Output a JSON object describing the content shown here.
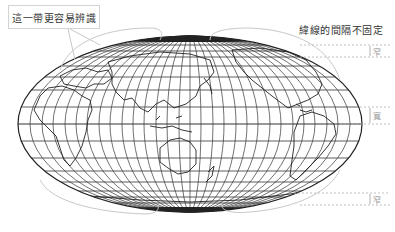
{
  "callout": {
    "text": "這一帶更容易辨識"
  },
  "note": {
    "text": "緯線的間隔不固定"
  },
  "bands": [
    {
      "label": "窄",
      "y_top": 45,
      "y_bottom": 57
    },
    {
      "label": "寬",
      "y_top": 107,
      "y_bottom": 124
    },
    {
      "label": "窄",
      "y_top": 193,
      "y_bottom": 205
    }
  ],
  "map": {
    "projection": "elliptical (Mollweide-like)",
    "center_longitude": "~150°E (Pacific-centered)",
    "ellipse": {
      "cx": 190,
      "cy": 124,
      "rx": 172,
      "ry": 88
    },
    "line_color": "#2a2a2a",
    "annotation_color": "#bdbdbd",
    "dash_color": "#b0b0b0"
  }
}
